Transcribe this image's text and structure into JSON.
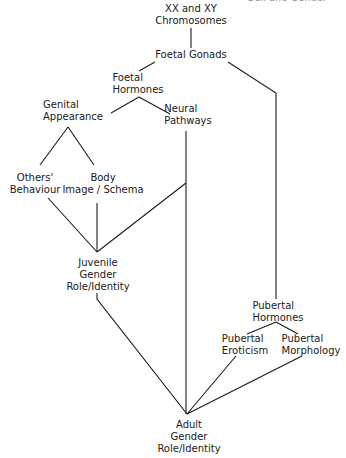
{
  "header": {
    "cut_off_text": "Sex and Gender"
  },
  "diagram": {
    "nodes": [
      {
        "id": "chromosomes",
        "lines": [
          "XX and XY",
          "Chromosomes"
        ]
      },
      {
        "id": "foetal-gonads",
        "lines": [
          "Foetal Gonads"
        ]
      },
      {
        "id": "foetal-hormones",
        "lines": [
          "Foetal",
          "Hormones"
        ]
      },
      {
        "id": "genital-appearance",
        "lines": [
          "Genital",
          "Appearance"
        ]
      },
      {
        "id": "neural-pathways",
        "lines": [
          "Neural",
          "Pathways"
        ]
      },
      {
        "id": "others-behaviour",
        "lines": [
          "Others'",
          "Behaviour"
        ]
      },
      {
        "id": "body-image",
        "lines": [
          "Body",
          "Image / Schema"
        ]
      },
      {
        "id": "juvenile-gender",
        "lines": [
          "Juvenile",
          "Gender",
          "Role/Identity"
        ]
      },
      {
        "id": "pubertal-hormones",
        "lines": [
          "Pubertal",
          "Hormones"
        ]
      },
      {
        "id": "pubertal-eroticism",
        "lines": [
          "Pubertal",
          "Eroticism"
        ]
      },
      {
        "id": "pubertal-morphology",
        "lines": [
          "Pubertal",
          "Morphology"
        ]
      },
      {
        "id": "adult-gender",
        "lines": [
          "Adult",
          "Gender",
          "Role/Identity"
        ]
      }
    ],
    "edges": [
      [
        "chromosomes",
        "foetal-gonads"
      ],
      [
        "foetal-gonads",
        "foetal-hormones"
      ],
      [
        "foetal-gonads",
        "pubertal-hormones"
      ],
      [
        "foetal-hormones",
        "genital-appearance"
      ],
      [
        "foetal-hormones",
        "neural-pathways"
      ],
      [
        "genital-appearance",
        "others-behaviour"
      ],
      [
        "genital-appearance",
        "body-image"
      ],
      [
        "others-behaviour",
        "juvenile-gender"
      ],
      [
        "body-image",
        "juvenile-gender"
      ],
      [
        "neural-pathways",
        "juvenile-gender"
      ],
      [
        "neural-pathways",
        "adult-gender"
      ],
      [
        "juvenile-gender",
        "adult-gender"
      ],
      [
        "pubertal-hormones",
        "pubertal-eroticism"
      ],
      [
        "pubertal-hormones",
        "pubertal-morphology"
      ],
      [
        "pubertal-eroticism",
        "adult-gender"
      ],
      [
        "pubertal-morphology",
        "adult-gender"
      ]
    ],
    "colors": {
      "line": "#1a1a1a",
      "text": "#1a1a1a",
      "background": "#ffffff"
    }
  }
}
